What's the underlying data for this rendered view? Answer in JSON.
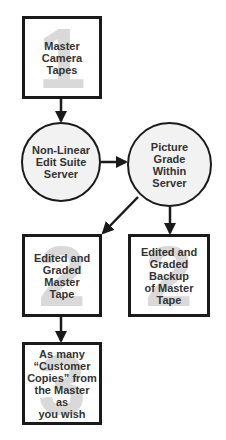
{
  "diagram": {
    "nodes": [
      {
        "id": "master-camera-tapes",
        "shape": "box",
        "watermark": "1",
        "lines": [
          "Master",
          "Camera",
          "Tapes"
        ]
      },
      {
        "id": "non-linear-edit",
        "shape": "circle",
        "lines": [
          "Non-Linear",
          "Edit Suite",
          "Server"
        ]
      },
      {
        "id": "picture-grade",
        "shape": "circle",
        "lines": [
          "Picture",
          "Grade",
          "Within",
          "Server"
        ]
      },
      {
        "id": "edited-graded-master",
        "shape": "box",
        "watermark": "2",
        "lines": [
          "Edited and",
          "Graded",
          "Master",
          "Tape"
        ]
      },
      {
        "id": "edited-graded-backup",
        "shape": "box",
        "watermark": "2",
        "lines": [
          "Edited and",
          "Graded",
          "Backup",
          "of Master",
          "Tape"
        ]
      },
      {
        "id": "customer-copies",
        "shape": "box",
        "watermark": "3",
        "lines": [
          "As many",
          "“Customer",
          "Copies” from",
          "the Master as",
          "you wish"
        ]
      }
    ],
    "edges": [
      {
        "from": "master-camera-tapes",
        "to": "non-linear-edit"
      },
      {
        "from": "non-linear-edit",
        "to": "picture-grade"
      },
      {
        "from": "picture-grade",
        "to": "edited-graded-master"
      },
      {
        "from": "picture-grade",
        "to": "edited-graded-backup"
      },
      {
        "from": "edited-graded-master",
        "to": "customer-copies"
      }
    ],
    "colors": {
      "stroke": "#1a1a1a",
      "text": "#333333",
      "watermark": "#d9d9d9",
      "circle_fill": "#f2f2f2"
    }
  }
}
